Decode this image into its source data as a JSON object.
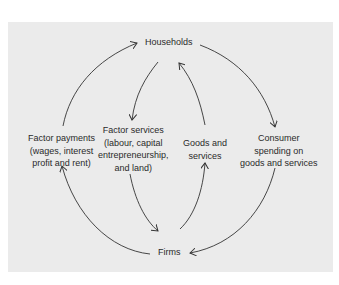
{
  "diagram": {
    "nodes": {
      "households": "Households",
      "firms": "Firms"
    },
    "flows": {
      "factor_payments": [
        "Factor payments",
        "(wages, interest",
        "profit and rent)"
      ],
      "factor_services": [
        "Factor services",
        "(labour, capital",
        "entrepreneurship,",
        "and land)"
      ],
      "goods_services": [
        "Goods and",
        "services"
      ],
      "consumer_spending": [
        "Consumer",
        "spending on",
        "goods and services"
      ]
    },
    "colors": {
      "panel": "#ebebeb",
      "line": "#333333",
      "text": "#2a2a2a"
    }
  }
}
